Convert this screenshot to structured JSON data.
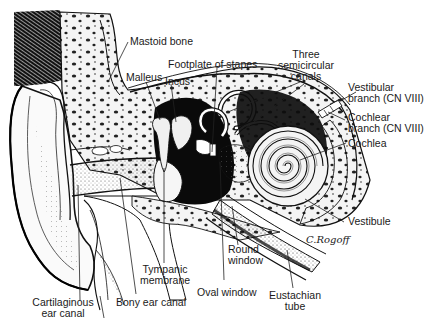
{
  "diagram": {
    "labels": [
      {
        "id": "mastoid-bone",
        "lines": [
          "Mastoid bone"
        ],
        "x": 130,
        "y": 35,
        "align": "left",
        "leader": [
          [
            128,
            42
          ],
          [
            108,
            80
          ]
        ]
      },
      {
        "id": "malleus",
        "lines": [
          "Malleus"
        ],
        "x": 127,
        "y": 71,
        "align": "left",
        "leader": [
          [
            146,
            82
          ],
          [
            160,
            118
          ]
        ]
      },
      {
        "id": "incus",
        "lines": [
          "Incus"
        ],
        "x": 164,
        "y": 73,
        "align": "left",
        "leader": [
          [
            170,
            84
          ],
          [
            175,
            120
          ]
        ]
      },
      {
        "id": "footplate-of-stapes",
        "lines": [
          "Footplate of stapes"
        ],
        "x": 168,
        "y": 58,
        "align": "left",
        "leader": [
          [
            217,
            68
          ],
          [
            213,
            152
          ]
        ]
      },
      {
        "id": "three-semicircular-canals",
        "lines": [
          "Three",
          "semicircular",
          "canals"
        ],
        "x": 304,
        "y": 48,
        "align": "center",
        "leader": [
          [
            305,
            82
          ],
          [
            228,
            110
          ],
          [
            305,
            82
          ],
          [
            248,
            125
          ]
        ]
      },
      {
        "id": "vestibular-branch",
        "lines": [
          "Vestibular",
          "branch (CN VIII)"
        ],
        "x": 347,
        "y": 83,
        "align": "left",
        "leader": [
          [
            343,
            97
          ],
          [
            318,
            112
          ]
        ]
      },
      {
        "id": "cochlear-branch",
        "lines": [
          "Cochlear",
          "branch (CN VIII)"
        ],
        "x": 347,
        "y": 115,
        "align": "left",
        "leader": [
          [
            345,
            122
          ],
          [
            326,
            114
          ]
        ]
      },
      {
        "id": "cochlea",
        "lines": [
          "Cochlea"
        ],
        "x": 348,
        "y": 138,
        "align": "left",
        "leader": [
          [
            346,
            143
          ],
          [
            300,
            155
          ]
        ]
      },
      {
        "id": "vestibule",
        "lines": [
          "Vestibule"
        ],
        "x": 347,
        "y": 214,
        "align": "left",
        "leader": [
          [
            344,
            222
          ],
          [
            305,
            198
          ]
        ]
      },
      {
        "id": "round-window",
        "lines": [
          "Round",
          "window"
        ],
        "x": 228,
        "y": 243,
        "align": "left",
        "leader": [
          [
            237,
            245
          ],
          [
            233,
            215
          ]
        ]
      },
      {
        "id": "oval-window",
        "lines": [
          "Oval window"
        ],
        "x": 197,
        "y": 283,
        "align": "left",
        "leader": [
          [
            224,
            279
          ],
          [
            223,
            175
          ]
        ]
      },
      {
        "id": "eustachian-tube",
        "lines": [
          "Eustachian",
          "tube"
        ],
        "x": 270,
        "y": 288,
        "align": "center",
        "leader": [
          [
            293,
            286
          ],
          [
            286,
            250
          ]
        ]
      },
      {
        "id": "tympanic-membrane",
        "lines": [
          "Tympanic",
          "membrane"
        ],
        "x": 165,
        "y": 262,
        "align": "center",
        "leader": [
          [
            164,
            262
          ],
          [
            164,
            170
          ]
        ]
      },
      {
        "id": "bony-ear-canal",
        "lines": [
          "Bony ear canal"
        ],
        "x": 116,
        "y": 296,
        "align": "left",
        "leader": [
          [
            137,
            293
          ],
          [
            122,
            175
          ]
        ]
      },
      {
        "id": "cartilaginous-ear-canal",
        "lines": [
          "Cartilaginous",
          "ear canal"
        ],
        "x": 33,
        "y": 295,
        "align": "center",
        "leader": [
          [
            81,
            300
          ],
          [
            80,
            183
          ]
        ]
      }
    ],
    "signature": "C.Rogoff"
  }
}
